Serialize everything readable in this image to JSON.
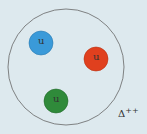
{
  "diagram": {
    "particle_label": "Δ++",
    "particle_base": "Δ",
    "particle_charge": "++",
    "quarks": [
      {
        "label": "u",
        "color": "#3a9ad9"
      },
      {
        "label": "u",
        "color": "#e0401e"
      },
      {
        "label": "u",
        "color": "#2f8a3a"
      }
    ],
    "background_color": "#dde9ee",
    "boundary_color": "#555555"
  }
}
